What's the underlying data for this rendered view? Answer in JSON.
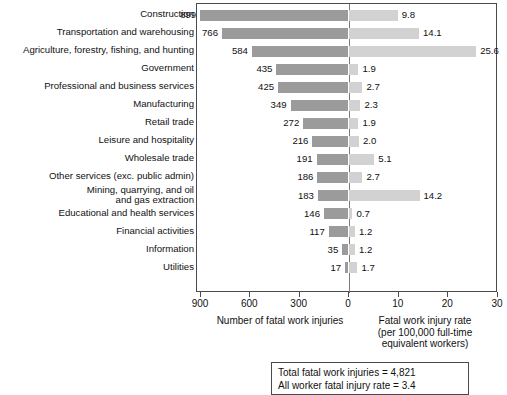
{
  "chart_data": {
    "type": "bar",
    "title": "",
    "subtitle": "",
    "orientation": "horizontal-bidirectional",
    "categories": [
      "Construction",
      "Transportation and warehousing",
      "Agriculture, forestry, fishing, and hunting",
      "Government",
      "Professional and business services",
      "Manufacturing",
      "Retail trade",
      "Leisure and hospitality",
      "Wholesale trade",
      "Other services (exc. public admin)",
      "Mining, quarrying, and oil\nand gas extraction",
      "Educational and health services",
      "Financial activities",
      "Information",
      "Utilities"
    ],
    "series": [
      {
        "name": "Number of fatal work injuries",
        "axis": "left",
        "values": [
          899,
          766,
          584,
          435,
          425,
          349,
          272,
          216,
          191,
          186,
          183,
          146,
          117,
          35,
          17
        ],
        "labels": [
          "899",
          "766",
          "584",
          "435",
          "425",
          "349",
          "272",
          "216",
          "191",
          "186",
          "183",
          "146",
          "117",
          "35",
          "17"
        ],
        "color": "#9b9b9b"
      },
      {
        "name": "Fatal work injury rate (per 100,000 full-time equivalent workers)",
        "axis": "right",
        "values": [
          9.8,
          14.1,
          25.6,
          1.9,
          2.7,
          2.3,
          1.9,
          2.0,
          5.1,
          2.7,
          14.2,
          0.7,
          1.2,
          1.2,
          1.7
        ],
        "labels": [
          "9.8",
          "14.1",
          "25.6",
          "1.9",
          "2.7",
          "2.3",
          "1.9",
          "2.0",
          "5.1",
          "2.7",
          "14.2",
          "0.7",
          "1.2",
          "1.2",
          "1.7"
        ],
        "color": "#d2d2d2"
      }
    ],
    "xlabel_left": "Number of fatal work injuries",
    "xlabel_right": "Fatal work injury rate\n(per 100,000 full-time\nequivalent workers)",
    "ylabel": "",
    "tick_labels": [
      "900",
      "600",
      "300",
      "0",
      "10",
      "20",
      "30"
    ],
    "xlim_left": [
      0,
      900
    ],
    "xlim_right": [
      0,
      30
    ],
    "grid": false,
    "legend": "none"
  },
  "axis": {
    "ticks": [
      {
        "label": "900"
      },
      {
        "label": "600"
      },
      {
        "label": "300"
      },
      {
        "label": "0"
      },
      {
        "label": "10"
      },
      {
        "label": "20"
      },
      {
        "label": "30"
      }
    ],
    "title_left": "Number of fatal work injuries",
    "title_right": "Fatal work injury rate\n(per 100,000 full-time\nequivalent workers)"
  },
  "note_box": {
    "line1": "Total fatal work injuries = 4,821",
    "line2": "All worker fatal injury rate = 3.4"
  },
  "colors": {
    "bar_left": "#9b9b9b",
    "bar_right": "#d2d2d2",
    "frame": "#4a4a4a",
    "zero_axis": "#7a7a7a"
  }
}
